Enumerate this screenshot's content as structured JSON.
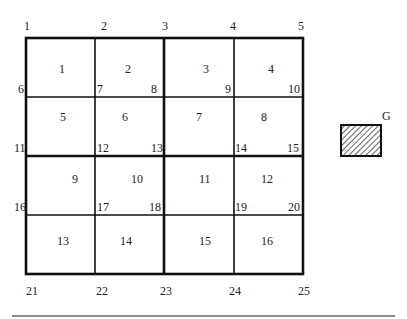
{
  "diagram": {
    "type": "finite-element-mesh",
    "grid": {
      "rows": 4,
      "cols": 4
    },
    "node_labels": [
      "1",
      "2",
      "3",
      "4",
      "5",
      "6",
      "7",
      "8",
      "9",
      "10",
      "11",
      "12",
      "13",
      "14",
      "15",
      "16",
      "17",
      "18",
      "19",
      "20",
      "21",
      "22",
      "23",
      "24",
      "25"
    ],
    "element_labels": [
      "1",
      "2",
      "3",
      "4",
      "5",
      "6",
      "7",
      "8",
      "9",
      "10",
      "11",
      "12",
      "13",
      "14",
      "15",
      "16"
    ],
    "legend": {
      "label": "G",
      "pattern": "diagonal-hatch"
    }
  }
}
